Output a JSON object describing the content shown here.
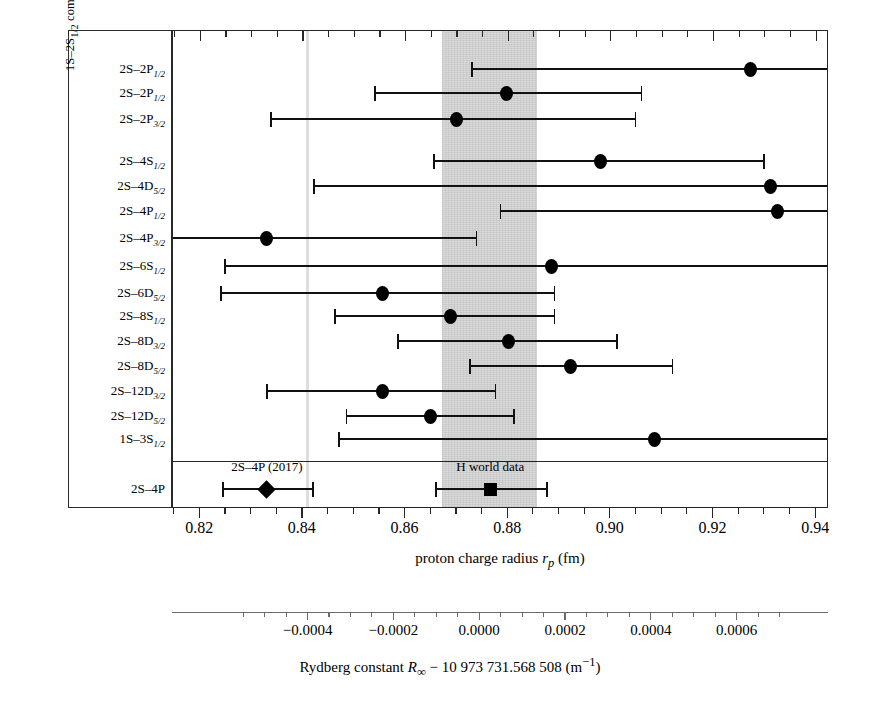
{
  "figure": {
    "group_axis_label": "1S–2S<sub>1/2</sub> combined with <i>nS–n'ℓ</i>",
    "xlabel_primary": "proton charge radius <i>r</i><sub><i>p</i></sub> (fm)",
    "xlabel_secondary": "Rydberg constant <i>R</i><sub>∞</sub> − 10 973 731.568 508 (m<sup>−1</sup>)",
    "band_label": "H world data",
    "note_2017": "2S–4P (2017)",
    "band_color": "#d9d9d9",
    "muon_line_color": "#dedede",
    "marker_color": "#000000"
  },
  "chart_data": {
    "type": "scatter",
    "title": "",
    "xlabel": "proton charge radius r_p (fm)",
    "ylabel": "1S–2S_1/2 combined with nS–n'ℓ",
    "xlim": [
      0.8147,
      0.9425
    ],
    "xticks": [
      0.82,
      0.84,
      0.86,
      0.88,
      0.9,
      0.92,
      0.94
    ],
    "xticklabels": [
      "0.82",
      "0.84",
      "0.86",
      "0.88",
      "0.90",
      "0.92",
      "0.94"
    ],
    "minor_tick_step": 0.005,
    "grid": false,
    "legend": "none",
    "secondary_axis": {
      "label": "Rydberg constant R_inf - 10 973 731.568 508 (m^-1)",
      "ticks": [
        -0.0004,
        -0.0002,
        0.0,
        0.0002,
        0.0004,
        0.0006
      ],
      "ticklabels": [
        "−0.0004",
        "−0.0002",
        "0.0000",
        "0.0002",
        "0.0004",
        "0.0006"
      ],
      "minor_tick_step": 5e-05
    },
    "shaded_band": {
      "name": "H world data",
      "xmin": 0.8672,
      "xmax": 0.8857,
      "color": "#d9d9d9"
    },
    "vertical_line": {
      "name": "muonic hydrogen",
      "x": 0.8409,
      "color": "#dedede"
    },
    "categories": [
      "2S–2P_1/2",
      "2S–2P_1/2",
      "2S–2P_3/2",
      "2S–4S_1/2",
      "2S–4D_5/2",
      "2S–4P_1/2",
      "2S–4P_3/2",
      "2S–6S_1/2",
      "2S–6D_5/2",
      "2S–8S_1/2",
      "2S–8D_3/2",
      "2S–8D_5/2",
      "2S–12D_3/2",
      "2S–12D_5/2",
      "1S–3S_1/2",
      "2S–4P"
    ],
    "points": [
      {
        "label": "2S–2P<sub>1/2</sub>",
        "value": 0.9272,
        "low": 0.873,
        "high": 0.964,
        "marker": "circle",
        "clip_high": true
      },
      {
        "label": "2S–2P<sub>1/2</sub>",
        "value": 0.8796,
        "low": 0.854,
        "high": 0.906,
        "marker": "circle"
      },
      {
        "label": "2S–2P<sub>3/2</sub>",
        "value": 0.87,
        "low": 0.8338,
        "high": 0.9048,
        "marker": "circle"
      },
      {
        "label": "2S–4S<sub>1/2</sub>",
        "value": 0.898,
        "low": 0.8655,
        "high": 0.9298,
        "marker": "circle"
      },
      {
        "label": "2S–4D<sub>5/2</sub>",
        "value": 0.9312,
        "low": 0.8422,
        "high": 0.95,
        "marker": "circle",
        "clip_high": true
      },
      {
        "label": "2S–4P<sub>1/2</sub>",
        "value": 0.9325,
        "low": 0.8785,
        "high": 0.95,
        "marker": "circle",
        "clip_high": true
      },
      {
        "label": "2S–4P<sub>3/2</sub>",
        "value": 0.833,
        "low": 0.809,
        "high": 0.8738,
        "marker": "circle",
        "clip_low": true
      },
      {
        "label": "2S–6S<sub>1/2</sub>",
        "value": 0.8885,
        "low": 0.8248,
        "high": 0.95,
        "marker": "circle",
        "clip_high": true
      },
      {
        "label": "2S–6D<sub>5/2</sub>",
        "value": 0.8555,
        "low": 0.824,
        "high": 0.889,
        "marker": "circle"
      },
      {
        "label": "2S–8S<sub>1/2</sub>",
        "value": 0.8688,
        "low": 0.8462,
        "high": 0.889,
        "marker": "circle"
      },
      {
        "label": "2S–8D<sub>3/2</sub>",
        "value": 0.88,
        "low": 0.8585,
        "high": 0.9012,
        "marker": "circle"
      },
      {
        "label": "2S–8D<sub>5/2</sub>",
        "value": 0.8922,
        "low": 0.8725,
        "high": 0.912,
        "marker": "circle"
      },
      {
        "label": "2S–12D<sub>3/2</sub>",
        "value": 0.8555,
        "low": 0.833,
        "high": 0.8775,
        "marker": "circle"
      },
      {
        "label": "2S–12D<sub>5/2</sub>",
        "value": 0.8648,
        "low": 0.8485,
        "high": 0.8812,
        "marker": "circle"
      },
      {
        "label": "1S–3S<sub>1/2</sub>",
        "value": 0.9085,
        "low": 0.847,
        "high": 0.95,
        "marker": "circle",
        "clip_high": true
      },
      {
        "label": "2S–4P",
        "value": 0.833,
        "low": 0.8245,
        "high": 0.842,
        "marker": "diamond",
        "note": "2S–4P (2017)"
      }
    ],
    "summary_point": {
      "label": "H world data",
      "value": 0.8765,
      "low": 0.866,
      "high": 0.8875,
      "marker": "square"
    }
  }
}
